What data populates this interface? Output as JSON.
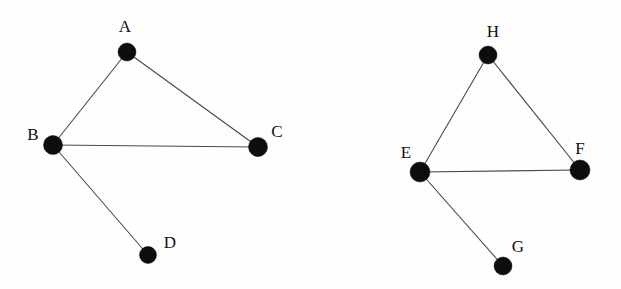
{
  "figure": {
    "width": 621,
    "height": 289,
    "background_color": "#fefefe",
    "node_color": "#0d0d0d",
    "edge_color": "#4a4a4a",
    "label_color": "#101010",
    "node_radius": 9,
    "edge_width": 1.1
  },
  "graphs": [
    {
      "name": "left-graph",
      "nodes": [
        {
          "id": "A",
          "label": "A",
          "x": 127,
          "y": 52,
          "r": 9,
          "label_x": 125,
          "label_y": 26
        },
        {
          "id": "B",
          "label": "B",
          "x": 53,
          "y": 145,
          "r": 9.5,
          "label_x": 33,
          "label_y": 134
        },
        {
          "id": "C",
          "label": "C",
          "x": 258,
          "y": 147,
          "r": 9.5,
          "label_x": 277,
          "label_y": 131
        },
        {
          "id": "D",
          "label": "D",
          "x": 148,
          "y": 255,
          "r": 8.5,
          "label_x": 170,
          "label_y": 242
        }
      ],
      "edges": [
        {
          "from": "A",
          "to": "B"
        },
        {
          "from": "A",
          "to": "C"
        },
        {
          "from": "B",
          "to": "C"
        },
        {
          "from": "B",
          "to": "D"
        }
      ]
    },
    {
      "name": "right-graph",
      "nodes": [
        {
          "id": "H",
          "label": "H",
          "x": 488,
          "y": 55,
          "r": 9,
          "label_x": 493,
          "label_y": 31
        },
        {
          "id": "E",
          "label": "E",
          "x": 420,
          "y": 172,
          "r": 10,
          "label_x": 406,
          "label_y": 152
        },
        {
          "id": "F",
          "label": "F",
          "x": 580,
          "y": 170,
          "r": 10,
          "label_x": 580,
          "label_y": 148
        },
        {
          "id": "G",
          "label": "G",
          "x": 503,
          "y": 266,
          "r": 9,
          "label_x": 518,
          "label_y": 246
        }
      ],
      "edges": [
        {
          "from": "H",
          "to": "E"
        },
        {
          "from": "H",
          "to": "F"
        },
        {
          "from": "E",
          "to": "F"
        },
        {
          "from": "E",
          "to": "G"
        }
      ]
    }
  ]
}
